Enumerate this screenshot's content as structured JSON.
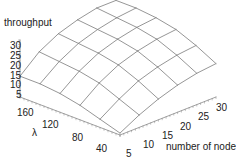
{
  "chart_data": {
    "type": "surface3d",
    "title": "",
    "zlabel": "throughput",
    "xlabel": "number of nodes",
    "ylabel": "λ",
    "z_ticks": [
      "30",
      "25",
      "20",
      "15",
      "10",
      "5"
    ],
    "x_ticks": [
      "5",
      "10",
      "15",
      "20",
      "25",
      "30"
    ],
    "y_ticks": [
      "160",
      "120",
      "80",
      "40"
    ],
    "x": [
      5,
      10,
      15,
      20,
      25,
      30
    ],
    "y": [
      40,
      64,
      88,
      112,
      136,
      160
    ],
    "z_range": [
      5,
      30
    ],
    "grid": false,
    "legend": "none",
    "style": "wireframe",
    "z_description": "throughput surface: low at few nodes / low λ, rising to a dome peak ~30 at high nodes and high λ",
    "z": [
      [
        3,
        8,
        12,
        15,
        17,
        18
      ],
      [
        6,
        12,
        17,
        20,
        22,
        23
      ],
      [
        9,
        16,
        21,
        24,
        26,
        27
      ],
      [
        11,
        18,
        23,
        26,
        28,
        29
      ],
      [
        12,
        19,
        24,
        27,
        29,
        30
      ],
      [
        12,
        20,
        25,
        28,
        30,
        30
      ]
    ]
  },
  "labels": {
    "zlabel": "throughput",
    "xlabel": "number of nodes",
    "ylabel": "λ"
  },
  "colors": {
    "line": "#8a8a8a",
    "axis": "#888888",
    "text": "#222222",
    "background": "#ffffff"
  }
}
